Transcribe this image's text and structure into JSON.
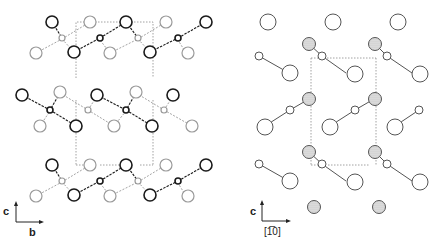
{
  "figure": {
    "panels": [
      {
        "id": "left",
        "view": "projection along a",
        "axes": {
          "vertical": "c",
          "horizontal": "b"
        }
      },
      {
        "id": "right",
        "view": "projection along [110]",
        "axes": {
          "vertical": "c",
          "horizontal": "[1̅0]"
        }
      }
    ],
    "colors": {
      "dark_atom": "#1a1a1a",
      "light_atom": "#9a9a9a",
      "shaded_fill": "#d8d8d8",
      "cell_line": "#8a8a8a"
    }
  },
  "labels": {
    "left_c": "c",
    "left_b": "b",
    "right_c": "c",
    "right_dir": "[1̅0]"
  }
}
